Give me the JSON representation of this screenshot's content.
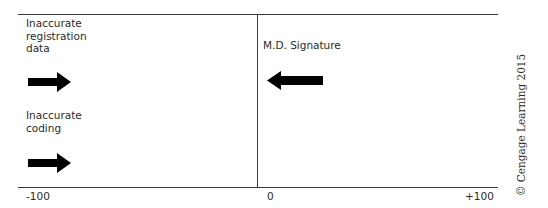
{
  "diagram": {
    "type": "force-field-analysis",
    "axis": {
      "min_label": "-100",
      "center_label": "0",
      "max_label": "+100"
    },
    "forces": [
      {
        "label": "Inaccurate registration data",
        "lines": [
          "Inaccurate",
          "registration",
          "data"
        ],
        "side": "left",
        "direction": "right"
      },
      {
        "label": "Inaccurate coding",
        "lines": [
          "Inaccurate",
          "coding"
        ],
        "side": "left",
        "direction": "right"
      },
      {
        "label": "M.D. Signature",
        "lines": [
          "M.D. Signature"
        ],
        "side": "right",
        "direction": "left"
      }
    ],
    "credit": "© Cengage Learning 2015",
    "colors": {
      "line": "#3a3a3a",
      "arrow": "#000000",
      "text": "#2a2a2a"
    }
  }
}
